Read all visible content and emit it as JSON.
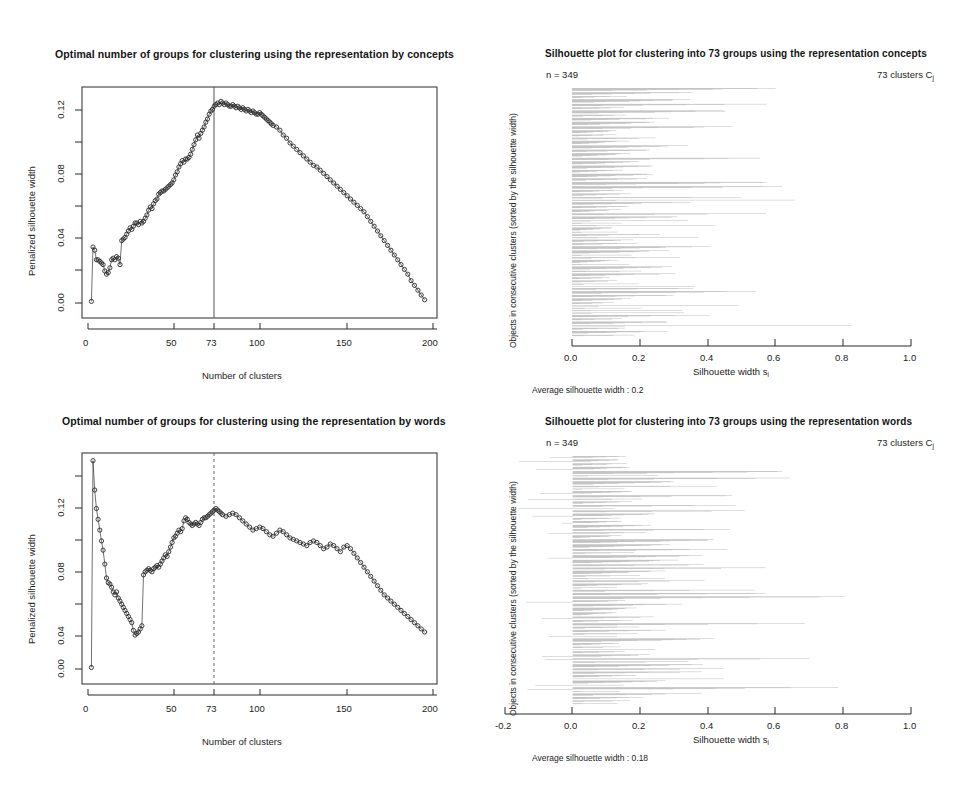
{
  "figure": {
    "background": "#ffffff",
    "ink": "#1a1a1a",
    "bar_color": "#b4b4b4"
  },
  "panels": {
    "top_left": {
      "title": "Optimal number of groups for clustering using the representation by concepts",
      "xlabel": "Number of clusters",
      "ylabel": "Penalized silhouette width",
      "xticks": [
        "0",
        "50",
        "73",
        "100",
        "150",
        "200"
      ],
      "yticks": [
        "0.12",
        "0.08",
        "0.04",
        "0.00"
      ],
      "marker_line_label": "73",
      "marker_line_style": "solid"
    },
    "bottom_left": {
      "title": "Optimal number of groups for clustering using the representation by words",
      "xlabel": "Number of clusters",
      "ylabel": "Penalized silhouette width",
      "xticks": [
        "0",
        "50",
        "73",
        "100",
        "150",
        "200"
      ],
      "yticks": [
        "0.12",
        "0.08",
        "0.04",
        "0.00"
      ],
      "marker_line_label": "73",
      "marker_line_style": "dashed"
    },
    "top_right": {
      "title": "Silhouette plot for clustering into 73 groups using the representation concepts",
      "n_label": "n = 349",
      "clusters_label": "73  clusters  C",
      "clusters_sub": "j",
      "ylabel": "Objects in consecutive clusters (sorted by the silhouette width)",
      "xlabel_main": "Silhouette width  s",
      "xlabel_sub": "i",
      "xticks": [
        "0.0",
        "0.2",
        "0.4",
        "0.6",
        "0.8",
        "1.0"
      ],
      "footer": "Average silhouette width :  0.2"
    },
    "bottom_right": {
      "title": "Silhouette plot for clustering into 73 groups using the representation words",
      "n_label": "n = 349",
      "clusters_label": "73  clusters  C",
      "clusters_sub": "j",
      "ylabel": "Objects in consecutive clusters (sorted by the silhouette width)",
      "xlabel_main": "Silhouette width  s",
      "xlabel_sub": "i",
      "xticks": [
        "-0.2",
        "0.0",
        "0.2",
        "0.4",
        "0.6",
        "0.8",
        "1.0"
      ],
      "footer": "Average silhouette width :  0.18"
    }
  },
  "chart_data": [
    {
      "id": "top_left",
      "type": "line",
      "title": "Optimal number of groups for clustering using the representation by concepts",
      "xlabel": "Number of clusters",
      "ylabel": "Penalized silhouette width",
      "xlim": [
        0,
        205
      ],
      "ylim": [
        0.0,
        0.135
      ],
      "grid": false,
      "vline": 73,
      "marker": "open-circle",
      "x": [
        2,
        3,
        4,
        5,
        6,
        7,
        8,
        9,
        10,
        11,
        12,
        13,
        14,
        15,
        16,
        17,
        18,
        19,
        20,
        21,
        22,
        23,
        24,
        25,
        26,
        27,
        28,
        29,
        30,
        31,
        32,
        33,
        34,
        35,
        36,
        37,
        38,
        39,
        40,
        41,
        42,
        43,
        44,
        45,
        46,
        47,
        48,
        49,
        50,
        51,
        52,
        53,
        54,
        55,
        56,
        57,
        58,
        59,
        60,
        61,
        62,
        63,
        64,
        65,
        66,
        67,
        68,
        69,
        70,
        71,
        72,
        73,
        74,
        75,
        76,
        77,
        78,
        79,
        80,
        81,
        82,
        83,
        84,
        85,
        86,
        87,
        88,
        89,
        90,
        91,
        92,
        93,
        94,
        95,
        96,
        97,
        98,
        99,
        100,
        101,
        102,
        103,
        104,
        105,
        106,
        107,
        108,
        109,
        110,
        112,
        114,
        116,
        118,
        120,
        122,
        124,
        126,
        128,
        130,
        132,
        134,
        136,
        138,
        140,
        142,
        144,
        146,
        148,
        150,
        152,
        154,
        156,
        158,
        160,
        162,
        164,
        166,
        168,
        170,
        172,
        174,
        176,
        178,
        180,
        182,
        184,
        186,
        188,
        190,
        192,
        194,
        196,
        198,
        200
      ],
      "y": [
        0.001,
        0.035,
        0.033,
        0.027,
        0.027,
        0.026,
        0.025,
        0.024,
        0.02,
        0.018,
        0.019,
        0.022,
        0.027,
        0.028,
        0.027,
        0.029,
        0.028,
        0.024,
        0.039,
        0.04,
        0.041,
        0.043,
        0.045,
        0.047,
        0.046,
        0.048,
        0.05,
        0.05,
        0.049,
        0.051,
        0.05,
        0.051,
        0.053,
        0.055,
        0.058,
        0.06,
        0.059,
        0.062,
        0.064,
        0.065,
        0.068,
        0.069,
        0.07,
        0.07,
        0.071,
        0.072,
        0.073,
        0.074,
        0.075,
        0.077,
        0.08,
        0.082,
        0.085,
        0.087,
        0.089,
        0.088,
        0.09,
        0.09,
        0.091,
        0.093,
        0.096,
        0.099,
        0.102,
        0.105,
        0.103,
        0.106,
        0.108,
        0.11,
        0.113,
        0.115,
        0.118,
        0.12,
        0.121,
        0.123,
        0.124,
        0.125,
        0.124,
        0.126,
        0.125,
        0.124,
        0.125,
        0.124,
        0.123,
        0.123,
        0.124,
        0.123,
        0.122,
        0.123,
        0.122,
        0.121,
        0.122,
        0.121,
        0.12,
        0.121,
        0.12,
        0.119,
        0.12,
        0.119,
        0.118,
        0.118,
        0.119,
        0.118,
        0.117,
        0.116,
        0.115,
        0.114,
        0.113,
        0.112,
        0.111,
        0.11,
        0.108,
        0.105,
        0.103,
        0.1,
        0.098,
        0.096,
        0.094,
        0.092,
        0.09,
        0.088,
        0.086,
        0.085,
        0.083,
        0.081,
        0.079,
        0.077,
        0.075,
        0.073,
        0.071,
        0.069,
        0.067,
        0.065,
        0.063,
        0.061,
        0.059,
        0.057,
        0.054,
        0.051,
        0.048,
        0.045,
        0.042,
        0.039,
        0.036,
        0.033,
        0.03,
        0.027,
        0.024,
        0.021,
        0.018,
        0.014,
        0.011,
        0.008,
        0.005,
        0.002
      ]
    },
    {
      "id": "bottom_left",
      "type": "line",
      "title": "Optimal number of groups for clustering using the representation by words",
      "xlabel": "Number of clusters",
      "ylabel": "Penalized silhouette width",
      "xlim": [
        0,
        205
      ],
      "ylim": [
        0.0,
        0.14
      ],
      "grid": false,
      "vline": 73,
      "marker": "open-circle",
      "x": [
        2,
        3,
        4,
        5,
        6,
        7,
        8,
        9,
        10,
        11,
        12,
        13,
        14,
        15,
        16,
        17,
        18,
        19,
        20,
        21,
        22,
        23,
        24,
        25,
        26,
        27,
        28,
        29,
        30,
        31,
        32,
        33,
        34,
        35,
        36,
        37,
        38,
        39,
        40,
        41,
        42,
        43,
        44,
        45,
        46,
        47,
        48,
        49,
        50,
        51,
        52,
        53,
        54,
        55,
        56,
        57,
        58,
        59,
        60,
        61,
        62,
        63,
        64,
        65,
        66,
        67,
        68,
        69,
        70,
        71,
        72,
        73,
        74,
        75,
        76,
        77,
        78,
        79,
        80,
        82,
        84,
        86,
        88,
        90,
        92,
        94,
        96,
        98,
        100,
        102,
        104,
        106,
        108,
        110,
        112,
        114,
        116,
        118,
        120,
        122,
        124,
        126,
        128,
        130,
        132,
        134,
        136,
        138,
        140,
        142,
        144,
        146,
        148,
        150,
        152,
        154,
        156,
        158,
        160,
        162,
        164,
        166,
        168,
        170,
        172,
        174,
        176,
        178,
        180,
        182,
        184,
        186,
        188,
        190,
        192,
        194,
        196,
        198,
        200
      ],
      "y": [
        0.001,
        0.135,
        0.116,
        0.104,
        0.097,
        0.09,
        0.083,
        0.077,
        0.068,
        0.059,
        0.056,
        0.055,
        0.053,
        0.05,
        0.048,
        0.05,
        0.046,
        0.044,
        0.042,
        0.04,
        0.038,
        0.036,
        0.034,
        0.032,
        0.03,
        0.025,
        0.022,
        0.023,
        0.024,
        0.026,
        0.028,
        0.061,
        0.063,
        0.064,
        0.065,
        0.064,
        0.063,
        0.065,
        0.066,
        0.067,
        0.066,
        0.068,
        0.07,
        0.072,
        0.074,
        0.073,
        0.076,
        0.079,
        0.082,
        0.085,
        0.086,
        0.088,
        0.09,
        0.089,
        0.091,
        0.096,
        0.098,
        0.097,
        0.095,
        0.094,
        0.093,
        0.094,
        0.095,
        0.094,
        0.093,
        0.095,
        0.097,
        0.098,
        0.098,
        0.099,
        0.1,
        0.101,
        0.102,
        0.103,
        0.104,
        0.103,
        0.102,
        0.101,
        0.1,
        0.099,
        0.1,
        0.101,
        0.1,
        0.098,
        0.096,
        0.094,
        0.092,
        0.09,
        0.091,
        0.092,
        0.091,
        0.089,
        0.087,
        0.086,
        0.088,
        0.09,
        0.089,
        0.087,
        0.085,
        0.084,
        0.083,
        0.082,
        0.081,
        0.08,
        0.082,
        0.083,
        0.082,
        0.08,
        0.078,
        0.079,
        0.081,
        0.08,
        0.078,
        0.076,
        0.079,
        0.08,
        0.078,
        0.075,
        0.072,
        0.069,
        0.066,
        0.063,
        0.06,
        0.057,
        0.054,
        0.051,
        0.048,
        0.046,
        0.044,
        0.042,
        0.04,
        0.038,
        0.036,
        0.034,
        0.032,
        0.03,
        0.028,
        0.026,
        0.024,
        0.022,
        0.02,
        0.019
      ]
    },
    {
      "id": "top_right",
      "type": "bar",
      "orientation": "horizontal",
      "title": "Silhouette plot for clustering into 73 groups using the representation concepts",
      "xlabel": "Silhouette width s_i",
      "ylabel": "Objects in consecutive clusters (sorted by the silhouette width)",
      "n": 349,
      "clusters": 73,
      "average_silhouette_width": 0.2,
      "xlim": [
        0.0,
        1.0
      ],
      "xticks": [
        0.0,
        0.2,
        0.4,
        0.6,
        0.8,
        1.0
      ],
      "grid": false,
      "bar_color": "#b4b4b4",
      "note": "349 thin horizontal bars grouped in 73 clusters; each cluster's bars sorted descending"
    },
    {
      "id": "bottom_right",
      "type": "bar",
      "orientation": "horizontal",
      "title": "Silhouette plot for clustering into 73 groups using the representation words",
      "xlabel": "Silhouette width s_i",
      "ylabel": "Objects in consecutive clusters (sorted by the silhouette width)",
      "n": 349,
      "clusters": 73,
      "average_silhouette_width": 0.18,
      "xlim": [
        -0.2,
        1.0
      ],
      "xticks": [
        -0.2,
        0.0,
        0.2,
        0.4,
        0.6,
        0.8,
        1.0
      ],
      "grid": false,
      "bar_color": "#b4b4b4",
      "note": "349 thin horizontal bars grouped in 73 clusters; a few bars extend to negative widths"
    }
  ]
}
